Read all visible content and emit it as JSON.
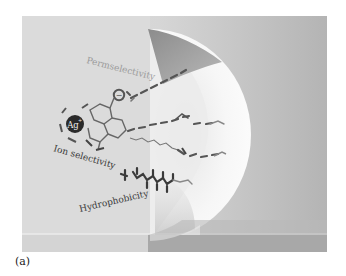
{
  "figure": {
    "panel_label": "(a)",
    "labels": {
      "permselectivity": "Permselectivity",
      "ion_selectivity": "Ion selectivity",
      "hydrophobicity": "Hydrophobicity",
      "ion": "Ag",
      "ion_charge": "+",
      "anion_symbol": "−"
    },
    "colors": {
      "background_light": "#dcdcdc",
      "background_right": "#bdbdbd",
      "sphere": "#f4f4f4",
      "wedge": "#9a9a9a",
      "ion_fill": "#2a2a2a",
      "permselectivity_text": "#9a9a9a",
      "label_text": "#3a3a3a"
    }
  }
}
